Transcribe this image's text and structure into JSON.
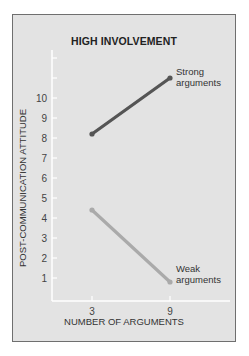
{
  "chart_data": {
    "type": "line",
    "title": "HIGH INVOLVEMENT",
    "xlabel": "NUMBER OF ARGUMENTS",
    "ylabel": "POST-COMMUNICATION ATTITUDE",
    "x": [
      3,
      9
    ],
    "x_tick_labels": [
      "3",
      "9"
    ],
    "y_tick_labels": [
      "1",
      "2",
      "3",
      "4",
      "5",
      "6",
      "7",
      "8",
      "9",
      "10"
    ],
    "ylim": [
      0,
      12
    ],
    "grid": false,
    "legend": "inline annotations at line ends",
    "series": [
      {
        "name": "Strong arguments",
        "values": [
          8.2,
          11.0
        ],
        "color": "#555555"
      },
      {
        "name": "Weak arguments",
        "values": [
          4.4,
          0.8
        ],
        "color": "#aaaaaa"
      }
    ]
  },
  "annotations": {
    "strong_line1": "Strong",
    "strong_line2": "arguments",
    "weak_line1": "Weak",
    "weak_line2": "arguments"
  }
}
